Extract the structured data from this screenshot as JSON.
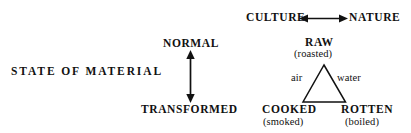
{
  "diagram": {
    "title_axis": {
      "left_axis_label": "STATE OF MATERIAL",
      "top_axis_left": "CULTURE",
      "top_axis_right": "NATURE"
    },
    "vertical_axis": {
      "top_label": "NORMAL",
      "bottom_label": "TRANSFORMED"
    },
    "triangle": {
      "apex": {
        "primary": "RAW",
        "secondary": "(roasted)"
      },
      "bottom_left": {
        "primary": "COOKED",
        "secondary": "(smoked)"
      },
      "bottom_right": {
        "primary": "ROTTEN",
        "secondary": "(boiled)"
      },
      "left_edge_label": "air",
      "right_edge_label": "water"
    },
    "colors": {
      "ink": "#111111",
      "background": "#ffffff"
    }
  }
}
